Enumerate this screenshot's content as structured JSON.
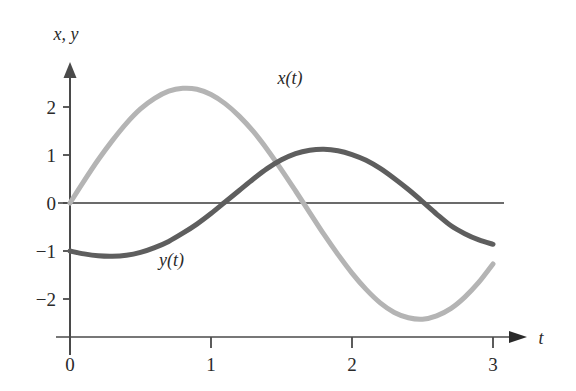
{
  "chart_data": {
    "type": "line",
    "title": "",
    "xlabel": "t",
    "ylabel": "x, y",
    "xlim": [
      -0.08,
      3.25
    ],
    "ylim": [
      -2.85,
      2.95
    ],
    "grid": false,
    "legend": "inline-labels",
    "x_ticks": [
      {
        "value": 0,
        "label": "0"
      },
      {
        "value": 1,
        "label": "1"
      },
      {
        "value": 2,
        "label": "2"
      },
      {
        "value": 3,
        "label": "3"
      }
    ],
    "y_ticks": [
      {
        "value": 2,
        "label": "2"
      },
      {
        "value": 1,
        "label": "1"
      },
      {
        "value": 0,
        "label": "0"
      },
      {
        "value": -1,
        "label": "−1"
      },
      {
        "value": -2,
        "label": "−2"
      }
    ],
    "annotations": [
      {
        "name": "x-curve-label",
        "text": "x(t)",
        "x": 1.56,
        "y": 2.47
      },
      {
        "name": "y-curve-label",
        "text": "y(t)",
        "x": 0.72,
        "y": -1.32
      }
    ],
    "series": [
      {
        "name": "x(t)",
        "label": "x(t)",
        "color": "#b4b4b4",
        "linewidth": 5,
        "x": [
          0,
          0.1,
          0.2,
          0.3,
          0.4,
          0.5,
          0.6,
          0.7,
          0.8,
          0.9,
          1.0,
          1.1,
          1.2,
          1.3,
          1.4,
          1.5,
          1.6,
          1.7,
          1.8,
          1.9,
          2.0,
          2.1,
          2.2,
          2.3,
          2.4,
          2.5,
          2.6,
          2.7,
          2.8,
          2.9,
          3.0
        ],
        "values": [
          0.0,
          0.46,
          0.9,
          1.3,
          1.66,
          1.96,
          2.18,
          2.33,
          2.39,
          2.37,
          2.26,
          2.07,
          1.81,
          1.49,
          1.11,
          0.69,
          0.25,
          -0.2,
          -0.65,
          -1.07,
          -1.46,
          -1.8,
          -2.08,
          -2.28,
          -2.39,
          -2.42,
          -2.35,
          -2.2,
          -1.96,
          -1.65,
          -1.27
        ]
      },
      {
        "name": "y(t)",
        "label": "y(t)",
        "color": "#5e5e5e",
        "linewidth": 5,
        "x": [
          0,
          0.1,
          0.2,
          0.3,
          0.4,
          0.5,
          0.6,
          0.7,
          0.8,
          0.9,
          1.0,
          1.1,
          1.2,
          1.3,
          1.4,
          1.5,
          1.6,
          1.7,
          1.8,
          1.9,
          2.0,
          2.1,
          2.2,
          2.3,
          2.4,
          2.5,
          2.6,
          2.7,
          2.8,
          2.9,
          3.0
        ],
        "values": [
          -1.0,
          -1.06,
          -1.1,
          -1.11,
          -1.09,
          -1.03,
          -0.93,
          -0.8,
          -0.63,
          -0.44,
          -0.22,
          0.02,
          0.26,
          0.5,
          0.72,
          0.9,
          1.03,
          1.1,
          1.12,
          1.09,
          1.01,
          0.89,
          0.72,
          0.51,
          0.28,
          0.03,
          -0.23,
          -0.47,
          -0.64,
          -0.77,
          -0.86
        ]
      }
    ]
  },
  "axes": {
    "y_axis_name": "vertical-axis",
    "x_axis_name": "horizontal-axis",
    "zero_line_name": "zero-reference-line",
    "y_axis_label": "x, y",
    "x_axis_label": "t"
  }
}
